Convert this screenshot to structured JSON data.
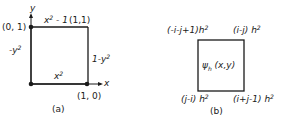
{
  "panel_a": {
    "caption": "(a)",
    "axis_x": "x",
    "axis_y": "y",
    "corner_tl": "(0, 1)",
    "corner_tr": "(1,1)",
    "corner_br": "(1, 0)",
    "edge_top": "x² - 1",
    "edge_left": "-y²",
    "edge_right": "1-y²",
    "edge_bottom": "x²"
  },
  "panel_b": {
    "caption": "(b)",
    "center": "ψh (x,y)",
    "corner_tl": "(-i-j+1)h²",
    "corner_tr": "(i-j) h²",
    "corner_bl": "(j-i) h²",
    "corner_br": "(i+j-1) h²"
  },
  "colors": {
    "line": "#1a1a1a",
    "background": "#ffffff"
  }
}
